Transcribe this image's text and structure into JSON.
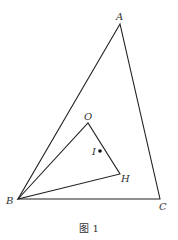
{
  "figure": {
    "caption": "图 1",
    "stroke_color": "#222222",
    "points": {
      "A": {
        "label": "A",
        "x": 120,
        "y": 24
      },
      "B": {
        "label": "B",
        "x": 18,
        "y": 199
      },
      "C": {
        "label": "C",
        "x": 160,
        "y": 199
      },
      "O": {
        "label": "O",
        "x": 88,
        "y": 123
      },
      "H": {
        "label": "H",
        "x": 120,
        "y": 174
      },
      "I": {
        "label": "I",
        "x": 100,
        "y": 151
      }
    },
    "segments": [
      "AB",
      "BC",
      "CA",
      "BO",
      "OH",
      "HB"
    ]
  }
}
